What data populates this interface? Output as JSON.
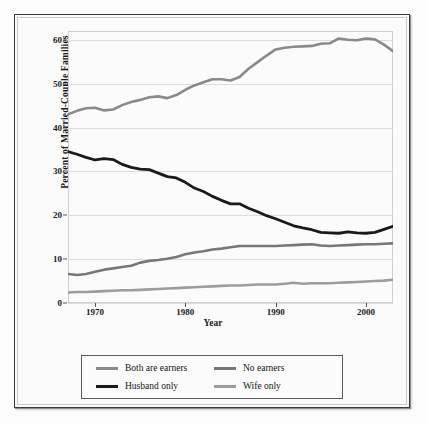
{
  "chart_data": {
    "type": "line",
    "title": "",
    "xlabel": "Year",
    "ylabel": "Percent of Married-Couple Families",
    "xlim": [
      1967,
      2003
    ],
    "ylim": [
      0,
      62
    ],
    "grid": true,
    "legend_position": "below-plot",
    "xticks": [
      "1970",
      "1980",
      "1990",
      "2000"
    ],
    "xtick_values": [
      1970,
      1980,
      1990,
      2000
    ],
    "yticks": [
      "0",
      "10",
      "20",
      "30",
      "40",
      "50",
      "60"
    ],
    "ytick_values": [
      0,
      10,
      20,
      30,
      40,
      50,
      60
    ],
    "x": [
      1967,
      1968,
      1969,
      1970,
      1971,
      1972,
      1973,
      1974,
      1975,
      1976,
      1977,
      1978,
      1979,
      1980,
      1981,
      1982,
      1983,
      1984,
      1985,
      1986,
      1987,
      1988,
      1989,
      1990,
      1991,
      1992,
      1993,
      1994,
      1995,
      1996,
      1997,
      1998,
      1999,
      2000,
      2001,
      2002,
      2003
    ],
    "series": [
      {
        "name": "Both are earners",
        "color": "#8a8a8a",
        "width": 2.6,
        "values": [
          43.0,
          43.8,
          44.4,
          44.5,
          43.9,
          44.1,
          45.1,
          45.8,
          46.3,
          46.9,
          47.1,
          46.7,
          47.4,
          48.6,
          49.6,
          50.3,
          51.0,
          51.0,
          50.7,
          51.5,
          53.4,
          54.9,
          56.4,
          57.8,
          58.2,
          58.4,
          58.5,
          58.6,
          59.1,
          59.2,
          60.3,
          60.0,
          59.9,
          60.3,
          60.1,
          58.9,
          57.4
        ]
      },
      {
        "name": "Husband only",
        "color": "#1a1a1a",
        "width": 2.8,
        "values": [
          34.5,
          33.9,
          33.2,
          32.6,
          32.9,
          32.7,
          31.6,
          30.9,
          30.5,
          30.4,
          29.6,
          28.8,
          28.5,
          27.5,
          26.2,
          25.4,
          24.3,
          23.4,
          22.6,
          22.6,
          21.6,
          20.8,
          19.9,
          19.2,
          18.4,
          17.6,
          17.1,
          16.7,
          16.1,
          16.0,
          15.9,
          16.2,
          16.0,
          15.9,
          16.1,
          16.8,
          17.5
        ]
      },
      {
        "name": "No earners",
        "color": "#777777",
        "width": 2.6,
        "values": [
          6.6,
          6.4,
          6.6,
          7.1,
          7.6,
          7.9,
          8.2,
          8.5,
          9.2,
          9.6,
          9.8,
          10.1,
          10.5,
          11.1,
          11.5,
          11.8,
          12.2,
          12.4,
          12.7,
          13.0,
          13.0,
          13.0,
          13.0,
          13.0,
          13.1,
          13.2,
          13.3,
          13.4,
          13.1,
          13.0,
          13.1,
          13.2,
          13.3,
          13.4,
          13.4,
          13.5,
          13.6
        ]
      },
      {
        "name": "Wife only",
        "color": "#9c9c9c",
        "width": 2.6,
        "values": [
          2.4,
          2.5,
          2.5,
          2.6,
          2.7,
          2.8,
          2.9,
          2.9,
          3.0,
          3.1,
          3.2,
          3.3,
          3.4,
          3.5,
          3.6,
          3.7,
          3.8,
          3.9,
          4.0,
          4.0,
          4.1,
          4.2,
          4.2,
          4.2,
          4.4,
          4.6,
          4.4,
          4.5,
          4.5,
          4.5,
          4.6,
          4.7,
          4.8,
          4.9,
          5.0,
          5.1,
          5.3
        ]
      }
    ]
  },
  "legend": {
    "items": [
      {
        "label": "Both are earners",
        "color": "#8a8a8a"
      },
      {
        "label": "No earners",
        "color": "#777777"
      },
      {
        "label": "Husband only",
        "color": "#1a1a1a"
      },
      {
        "label": "Wife only",
        "color": "#9c9c9c"
      }
    ]
  }
}
